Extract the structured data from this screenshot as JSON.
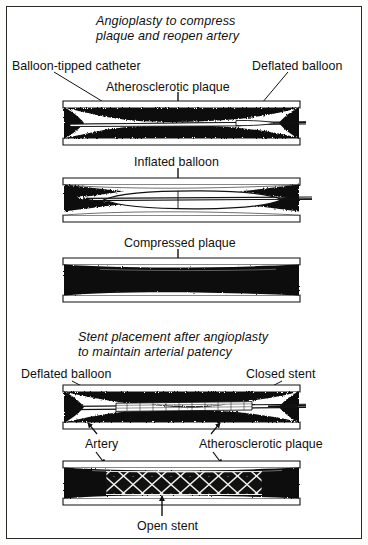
{
  "figure": {
    "type": "medical-illustration",
    "background_color": "#ffffff",
    "frame_color": "#2a2a2a",
    "ink_color": "#111111",
    "plaque_color": "#111111",
    "vessel_wall_color": "#ffffff"
  },
  "headings": {
    "angioplasty_line1": "Angioplasty  to  compress",
    "angioplasty_line2": "plaque and reopen artery",
    "stent_line1": "Stent placement after angioplasty",
    "stent_line2": "to maintain arterial patency"
  },
  "labels": {
    "balloon_tipped_catheter": "Balloon-tipped catheter",
    "deflated_balloon_top": "Deflated balloon",
    "atherosclerotic_plaque_top": "Atherosclerotic plaque",
    "inflated_balloon": "Inflated balloon",
    "compressed_plaque": "Compressed plaque",
    "deflated_balloon_bottom": "Deflated balloon",
    "closed_stent": "Closed stent",
    "artery": "Artery",
    "atherosclerotic_plaque_bottom": "Atherosclerotic plaque",
    "open_stent": "Open stent"
  },
  "panels": [
    {
      "id": "panel-1",
      "caption": "Artery narrowed by atherosclerotic plaque with deflated balloon-tipped catheter inserted",
      "stage": "catheter-inserted"
    },
    {
      "id": "panel-2",
      "caption": "Balloon inflated, compressing plaque against the arterial wall",
      "stage": "balloon-inflated"
    },
    {
      "id": "panel-3",
      "caption": "Plaque compressed and artery lumen reopened after balloon removal",
      "stage": "plaque-compressed"
    },
    {
      "id": "panel-4",
      "caption": "Closed stent mounted on deflated balloon positioned across the plaque",
      "stage": "stent-closed"
    },
    {
      "id": "panel-5",
      "caption": "Open stent expanded, holding the artery open",
      "stage": "stent-open"
    }
  ]
}
